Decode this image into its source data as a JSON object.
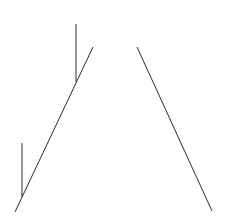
{
  "canvas": {
    "width": 226,
    "height": 223,
    "background_color": "#ffffff"
  },
  "drawing": {
    "description": "abstract line sketch: two long diagonals forming an open inverted-V with two short vertical tick strokes ending on the left diagonal",
    "stroke_color": "#2b2b2b",
    "stroke_width": 1,
    "lines": [
      {
        "name": "left-diagonal-line",
        "x1": 93,
        "y1": 47,
        "x2": 15,
        "y2": 212
      },
      {
        "name": "right-diagonal-line",
        "x1": 137,
        "y1": 47,
        "x2": 212,
        "y2": 211
      },
      {
        "name": "upper-vertical-tick",
        "x1": 76,
        "y1": 24,
        "x2": 76,
        "y2": 82
      },
      {
        "name": "lower-vertical-tick",
        "x1": 22,
        "y1": 143,
        "x2": 22,
        "y2": 197
      }
    ]
  }
}
